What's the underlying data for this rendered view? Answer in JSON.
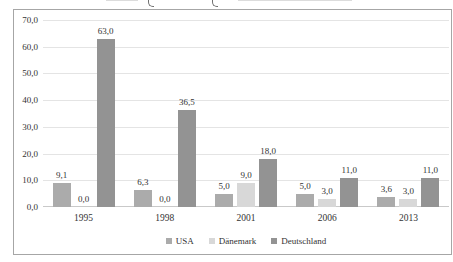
{
  "chart_data": {
    "type": "bar",
    "categories": [
      "1995",
      "1998",
      "2001",
      "2006",
      "2013"
    ],
    "series": [
      {
        "name": "USA",
        "color": "#ababab",
        "values": [
          9.1,
          6.3,
          5.0,
          5.0,
          3.6
        ],
        "labels": [
          "9,1",
          "6,3",
          "5,0",
          "5,0",
          "3,6"
        ]
      },
      {
        "name": "Dänemark",
        "color": "#d8d8d8",
        "values": [
          0.0,
          0.0,
          9.0,
          3.0,
          3.0
        ],
        "labels": [
          "0,0",
          "0,0",
          "9,0",
          "3,0",
          "3,0"
        ]
      },
      {
        "name": "Deutschland",
        "color": "#939393",
        "values": [
          63.0,
          36.5,
          18.0,
          11.0,
          11.0
        ],
        "labels": [
          "63,0",
          "36,5",
          "18,0",
          "11,0",
          "11,0"
        ]
      }
    ],
    "ylim": [
      0,
      70
    ],
    "ytick_step": 10,
    "ytick_labels": [
      "0,0",
      "10,0",
      "20,0",
      "30,0",
      "40,0",
      "50,0",
      "60,0",
      "70,0"
    ],
    "grid": true,
    "gridline_color": "#e4e4e4",
    "frame_border_color": "#a6a6a6",
    "text_color": "#333333",
    "legend_position": "bottom"
  }
}
